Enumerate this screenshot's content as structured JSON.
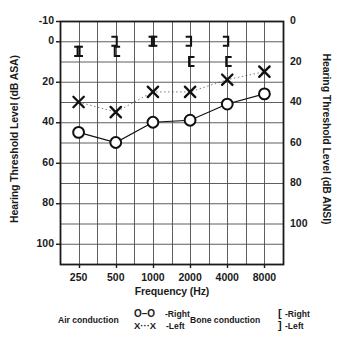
{
  "chart_data": {
    "type": "line",
    "title": "",
    "xlabel": "Frequency (Hz)",
    "ylabel": "Hearing Threshold Level (dB ASA)",
    "ylabel_right": "Hearing Threshold Level (dB ANSI)",
    "categories": [
      "250",
      "500",
      "1000",
      "2000",
      "4000",
      "8000"
    ],
    "x": [
      250,
      500,
      1000,
      2000,
      4000,
      8000
    ],
    "ylim": [
      -10,
      110
    ],
    "yticks_left": [
      "-10",
      "0",
      "20",
      "40",
      "60",
      "80",
      "100"
    ],
    "yticks_left_values": [
      -10,
      0,
      20,
      40,
      60,
      80,
      100
    ],
    "yticks_right": [
      "0",
      "20",
      "40",
      "60",
      "80",
      "100"
    ],
    "yticks_right_values": [
      0,
      20,
      40,
      60,
      80,
      100
    ],
    "ytick_offset_right_vs_left": 10,
    "grid": true,
    "grid_step_db": 10,
    "legend_position": "below",
    "series": [
      {
        "name": "Air conduction - Right",
        "symbol": "O",
        "linestyle": "solid",
        "values": [
          45,
          50,
          40,
          39,
          31,
          26
        ]
      },
      {
        "name": "Air conduction - Left",
        "symbol": "X",
        "linestyle": "dotted",
        "values": [
          30,
          35,
          25,
          25,
          19,
          15
        ]
      },
      {
        "name": "Bone conduction - Right",
        "symbol": "[",
        "linestyle": "none",
        "values": [
          5,
          5,
          0,
          10,
          10,
          null
        ]
      },
      {
        "name": "Bone conduction - Left",
        "symbol": "]",
        "linestyle": "none",
        "values": [
          5,
          0,
          0,
          0,
          0,
          null
        ]
      }
    ]
  },
  "legend": {
    "air_title": "Air conduction",
    "air_right_symbol": "O–O",
    "air_right_label": "-Right",
    "air_left_symbol": "X···X",
    "air_left_label": "-Left",
    "bone_title": "Bone conduction",
    "bone_right_symbol": "[",
    "bone_right_label": "-Right",
    "bone_left_symbol": "]",
    "bone_left_label": "-Left"
  },
  "colors": {
    "axis": "#1a1a1a",
    "grid": "#4d4d4d",
    "data": "#111111"
  }
}
